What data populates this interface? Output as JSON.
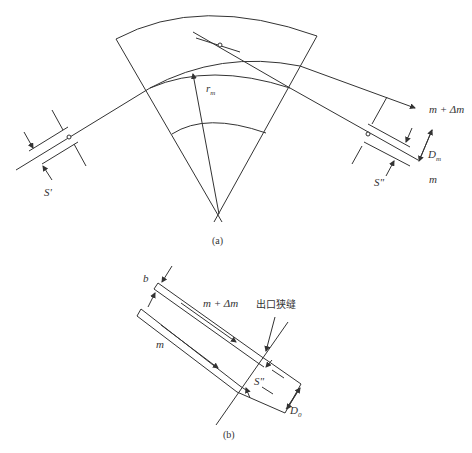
{
  "figure_a": {
    "caption": "(a)",
    "labels": {
      "radius": "r",
      "radius_sub": "m",
      "entrance_slit": "S'",
      "exit_slit": "S\"",
      "heavy_beam": "m + Δm",
      "light_beam": "m",
      "dispersion": "D",
      "dispersion_sub": "m"
    }
  },
  "figure_b": {
    "caption": "(b)",
    "labels": {
      "width": "b",
      "heavy_beam": "m + Δm",
      "light_beam": "m",
      "exit_slit_cn": "出口狭缝",
      "exit_slit": "S\"",
      "dispersion": "D",
      "dispersion_sub": "0"
    }
  },
  "colors": {
    "line": "#333333",
    "background": "#ffffff"
  }
}
